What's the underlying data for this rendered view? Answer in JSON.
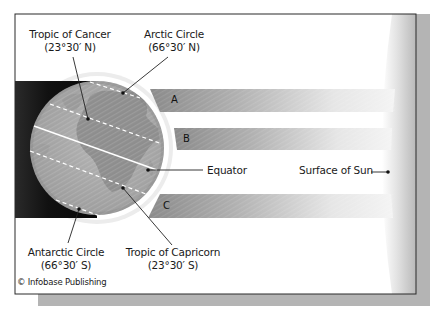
{
  "figure": {
    "colors": {
      "frame_border": "#2a2a2a",
      "drop_shadow": "#b4b4b4",
      "night_side": "#151515",
      "globe_ocean": "#a9a9a9",
      "globe_land": "#8c8c8c",
      "beam_dark": "#8f8f8f",
      "beam_light": "#f2f2f2",
      "sun_surface": "#c8c8c8",
      "latitude_line": "#ffffff",
      "leader_line": "#222222"
    }
  },
  "labels": {
    "tropic_of_cancer": {
      "name": "Tropic of Cancer",
      "latitude": "(23°30′ N)"
    },
    "arctic_circle": {
      "name": "Arctic Circle",
      "latitude": "(66°30′ N)"
    },
    "antarctic_circle": {
      "name": "Antarctic Circle",
      "latitude": "(66°30′ S)"
    },
    "tropic_of_capricorn": {
      "name": "Tropic of Capricorn",
      "latitude": "(23°30′ S)"
    },
    "equator": "Equator",
    "surface_of_sun": "Surface of Sun"
  },
  "beams": [
    {
      "id": "A",
      "label": "A"
    },
    {
      "id": "B",
      "label": "B"
    },
    {
      "id": "C",
      "label": "C"
    }
  ],
  "credit": "© Infobase Publishing"
}
